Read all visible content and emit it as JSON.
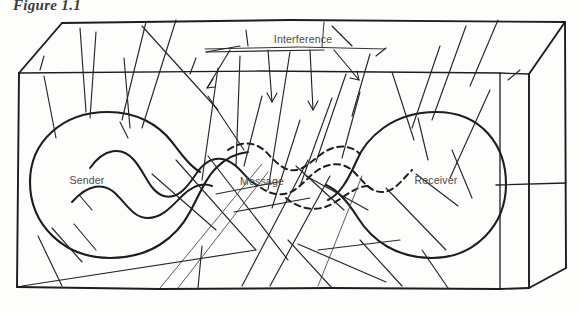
{
  "figure": {
    "caption": "Figure 1.1",
    "type": "communication-model-diagram",
    "background_color": "#fdfdfc",
    "ink_color": "#1d1d1d",
    "label_color": "#4a4a4a"
  },
  "labels": {
    "interference": "Interference",
    "sender": "Sender",
    "message": "Message",
    "receiver": "Receiver"
  },
  "nodes": [
    {
      "id": "sender",
      "label": "Sender",
      "cx": 120,
      "cy": 180,
      "shape": "blob"
    },
    {
      "id": "message",
      "label": "Message",
      "cx": 262,
      "cy": 182,
      "shape": "wave"
    },
    {
      "id": "receiver",
      "label": "Receiver",
      "cx": 432,
      "cy": 180,
      "shape": "blob"
    }
  ],
  "annotations": [
    {
      "id": "interference-callout",
      "label": "Interference",
      "label_x": 303,
      "label_y": 40,
      "leader_y": 48,
      "leader_x1": 205,
      "leader_x2": 385,
      "arrow_count": 4
    }
  ],
  "container": {
    "id": "environment-box",
    "description": "3D perspective box enclosing the communication model",
    "front_left_x": 18,
    "front_right_x": 530,
    "front_top_y": 72,
    "front_bottom_y": 288,
    "back_left_x": 62,
    "back_right_x": 566,
    "back_top_y": 22
  },
  "noise": {
    "description": "random interference scratch lines crossing the field",
    "line_count": 46
  }
}
